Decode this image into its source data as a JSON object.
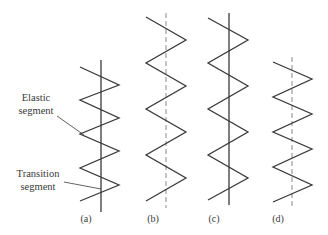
{
  "figure": {
    "background": "#ffffff",
    "stroke_color": "#3a3a3a",
    "annotations": [
      {
        "lines": [
          "Elastic",
          "segment"
        ],
        "x": 36,
        "y": [
          101,
          114
        ],
        "leader": [
          57,
          116,
          84,
          135
        ]
      },
      {
        "lines": [
          "Transition",
          "segment"
        ],
        "x": 38,
        "y": [
          177,
          190
        ],
        "leader": [
          64,
          182,
          101,
          189
        ]
      }
    ],
    "springs": [
      {
        "label": "(a)",
        "label_x": 86,
        "axis": {
          "x": 101,
          "y1": 60,
          "y2": 212,
          "dashed": false
        },
        "zigzag": "80,67 119,85 80,100 119,118 80,134 119,151 80,168 119,185 80,201"
      },
      {
        "label": "(b)",
        "label_x": 153,
        "axis": {
          "x": 166,
          "y1": 13,
          "y2": 208,
          "dashed": true
        },
        "zigzag": "146,17 186,40 146,63 186,86 146,109 186,132 146,155 186,178 146,201"
      },
      {
        "label": "(c)",
        "label_x": 214,
        "axis": {
          "x": 229,
          "y1": 13,
          "y2": 205,
          "dashed": false
        },
        "zigzag": "208,18 248,40 208,63 248,86 208,109 248,132 208,155 248,178 208,200"
      },
      {
        "label": "(d)",
        "label_x": 278,
        "axis": {
          "x": 292,
          "y1": 57,
          "y2": 207,
          "dashed": true
        },
        "zigzag": "273,62 312,79 273,97 312,114 273,132 312,149 273,167 312,185 273,202"
      }
    ],
    "label_y": 222
  }
}
